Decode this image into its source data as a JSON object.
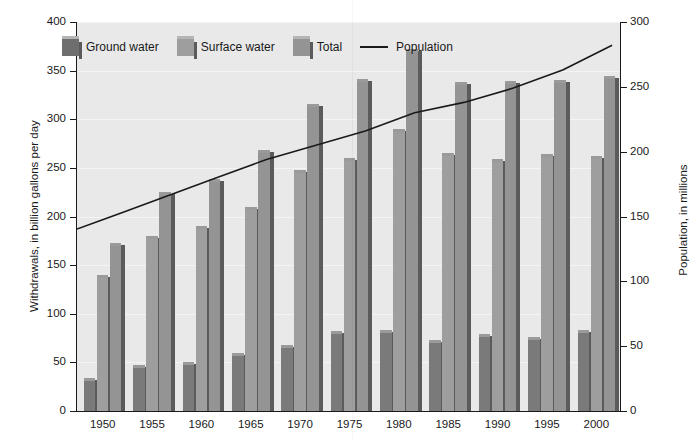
{
  "chart_data": {
    "type": "bar",
    "title": "",
    "xlabel": "",
    "ylabel": "Withdrawals, in billion gallons per day",
    "y2label": "Population, in millions",
    "ylim": [
      0,
      400
    ],
    "y2lim": [
      0,
      300
    ],
    "grid": true,
    "legend_position": "top-left",
    "categories": [
      "1950",
      "1955",
      "1960",
      "1965",
      "1970",
      "1975",
      "1980",
      "1985",
      "1990",
      "1995",
      "2000"
    ],
    "yticks": [
      "0",
      "50",
      "100",
      "150",
      "200",
      "250",
      "300",
      "350",
      "400"
    ],
    "y2ticks": [
      "0",
      "50",
      "100",
      "150",
      "200",
      "250",
      "300"
    ],
    "series": [
      {
        "name": "Ground water",
        "color": "#7a7a7a",
        "axis": "left",
        "values": [
          34,
          47,
          50,
          60,
          68,
          82,
          83,
          73,
          79,
          76,
          83
        ]
      },
      {
        "name": "Surface water",
        "color": "#9e9e9e",
        "axis": "left",
        "values": [
          140,
          180,
          190,
          210,
          248,
          260,
          290,
          265,
          259,
          264,
          262
        ]
      },
      {
        "name": "Total",
        "color": "#949494",
        "axis": "left",
        "values": [
          173,
          225,
          239,
          268,
          316,
          341,
          372,
          338,
          339,
          340,
          345
        ]
      },
      {
        "name": "Population",
        "color": "#1a1a1a",
        "axis": "right",
        "type": "line",
        "values": [
          152,
          166,
          180,
          194,
          205,
          216,
          230,
          238,
          249,
          263,
          282
        ]
      }
    ]
  },
  "legend": {
    "items": [
      {
        "label": "Ground water",
        "marker": "swatch"
      },
      {
        "label": "Surface water",
        "marker": "swatch"
      },
      {
        "label": "Total",
        "marker": "swatch"
      },
      {
        "label": "Population",
        "marker": "line"
      }
    ]
  },
  "axes": {
    "left_title": "Withdrawals, in billion gallons per day",
    "right_title": "Population, in millions"
  }
}
